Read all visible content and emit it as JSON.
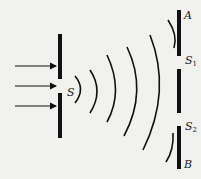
{
  "diagram": {
    "labels": {
      "source_slit": "S",
      "top_end": "A",
      "slit1": "S",
      "slit1_sub": "1",
      "slit2": "S",
      "slit2_sub": "2",
      "bottom_end": "B"
    },
    "incident_arrows": 3,
    "wavefronts": 5,
    "colors": {
      "ink": "#111111",
      "background": "#f1f1ef"
    }
  }
}
